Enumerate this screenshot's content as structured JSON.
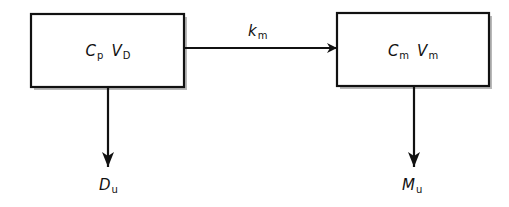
{
  "diagram": {
    "type": "compartment-model",
    "colors": {
      "stroke": "#111111",
      "shadow": "#9a9a9a",
      "background": "#ffffff"
    },
    "compartments": [
      {
        "id": "parent",
        "terms": [
          {
            "main": "C",
            "sub": "p"
          },
          {
            "main": "V",
            "sub": "D"
          }
        ]
      },
      {
        "id": "metabolite",
        "terms": [
          {
            "main": "C",
            "sub": "m"
          },
          {
            "main": "V",
            "sub": "m"
          }
        ]
      }
    ],
    "edges": [
      {
        "from": "parent",
        "to": "metabolite",
        "label": {
          "main": "k",
          "sub": "m"
        }
      },
      {
        "from": "parent",
        "to": "excreted-drug",
        "label": {
          "main": "D",
          "sub": "u"
        }
      },
      {
        "from": "metabolite",
        "to": "excreted-metabolite",
        "label": {
          "main": "M",
          "sub": "u"
        }
      }
    ]
  }
}
